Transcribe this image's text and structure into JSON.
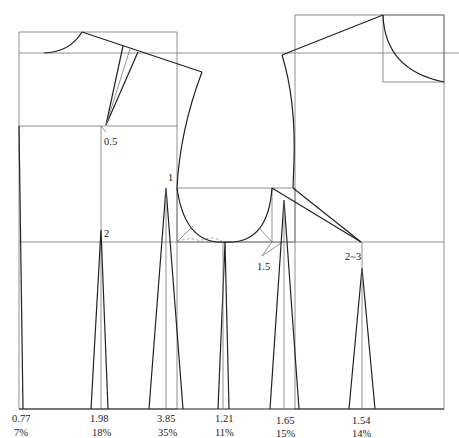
{
  "diagram": {
    "type": "garment-pattern-bodice-dart-distribution",
    "annotations": {
      "shoulder_dart": "0.5",
      "side_front_dart_apex": "1",
      "bust_dart_apex": "2",
      "armhole_offset": "1.5",
      "back_dart_apex": "2~3"
    },
    "darts": [
      {
        "amount": "0.77",
        "percent": "7%"
      },
      {
        "amount": "1.98",
        "percent": "18%"
      },
      {
        "amount": "3.85",
        "percent": "35%"
      },
      {
        "amount": "1.21",
        "percent": "11%"
      },
      {
        "amount": "1.65",
        "percent": "15%"
      },
      {
        "amount": "1.54",
        "percent": "14%"
      }
    ]
  }
}
